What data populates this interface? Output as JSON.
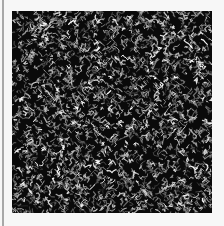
{
  "image": {
    "description": "Square grayscale noise texture with white worm-like edge strokes on black",
    "background_color": "#f7f7f7",
    "rule_color": "#a8a8a8",
    "texture": {
      "x": 12,
      "y": 11,
      "width": 200,
      "height": 202,
      "base_color": "#0a0a0a",
      "stroke_colors": [
        "#ffffff",
        "#d8d8d8",
        "#b0b0b0",
        "#8a8a8a",
        "#606060"
      ],
      "seed": 1337,
      "stroke_count": 2600
    }
  }
}
